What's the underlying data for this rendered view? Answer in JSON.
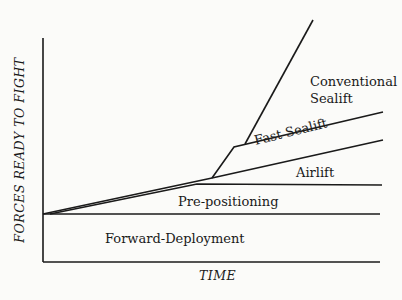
{
  "diagram": {
    "y_axis_label": "FORCES READY TO FIGHT",
    "x_axis_label": "TIME",
    "regions": {
      "conventional_sealift_line1": "Conventional",
      "conventional_sealift_line2": "Sealift",
      "fast_sealift": "Fast Sealift",
      "airlift": "Airlift",
      "pre_positioning": "Pre-positioning",
      "forward_deployment": "Forward-Deployment"
    },
    "line_color": "#1a1a1a",
    "background_color": "#fbfbf9"
  }
}
